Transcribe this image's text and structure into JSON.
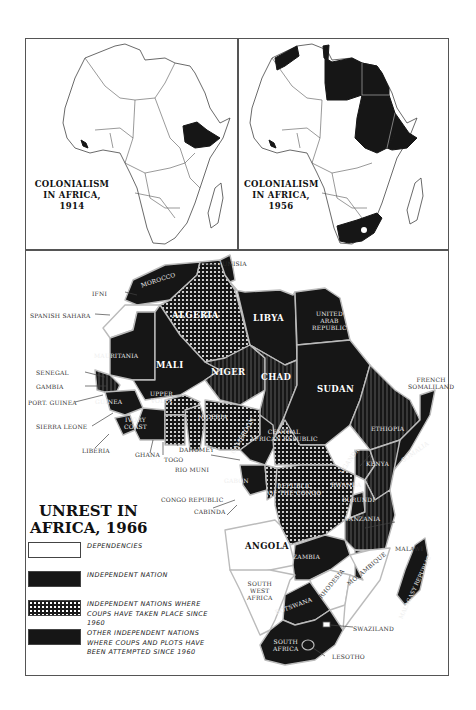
{
  "panels": {
    "map_1914": {
      "title_line1": "COLONIALISM",
      "title_line2": "IN AFRICA, 1914",
      "independent_shaded": [
        "Liberia",
        "Ethiopia"
      ]
    },
    "map_1956": {
      "title_line1": "COLONIALISM",
      "title_line2": "IN AFRICA, 1956",
      "independent_shaded": [
        "Morocco",
        "Tunisia",
        "Libya",
        "Egypt",
        "Sudan",
        "Ethiopia",
        "Liberia",
        "South Africa"
      ]
    },
    "map_1966": {
      "title_line1": "UNREST IN",
      "title_line2": "AFRICA, 1966"
    }
  },
  "legend": {
    "items": [
      {
        "key": "dependencies",
        "label": "DEPENDENCIES",
        "pattern": "white"
      },
      {
        "key": "independent",
        "label": "INDEPENDENT NATION",
        "pattern": "black"
      },
      {
        "key": "coups",
        "label": "INDEPENDENT NATIONS WHERE COUPS HAVE TAKEN PLACE SINCE 1960",
        "pattern": "dots"
      },
      {
        "key": "plots",
        "label": "OTHER INDEPENDENT NATIONS WHERE COUPS AND PLOTS HAVE BEEN ATTEMPTED SINCE 1960",
        "pattern": "lines"
      }
    ]
  },
  "labels": {
    "external": {
      "tunisia": "TUNISIA",
      "ifni": "IFNI",
      "spanish_sahara": "SPANISH SAHARA",
      "senegal": "SENEGAL",
      "gambia": "GAMBIA",
      "port_guinea": "PORT. GUINEA",
      "sierra_leone": "SIERRA LEONE",
      "liberia": "LIBERIA",
      "ghana": "GHANA",
      "togo": "TOGO",
      "dahomey": "DAHOMEY",
      "rio_muni": "RIO MUNI",
      "congo_republic": "CONGO REPUBLIC",
      "cabinda": "CABINDA",
      "french_somaliland_1": "FRENCH",
      "french_somaliland_2": "SOMALILAND",
      "malawi": "MALAWI",
      "swaziland": "SWAZILAND",
      "lesotho": "LESOTHO",
      "south_west_africa_1": "SOUTH",
      "south_west_africa_2": "WEST",
      "south_west_africa_3": "AFRICA"
    },
    "bold": {
      "algeria": "ALGERIA",
      "libya": "LIBYA",
      "mali": "MALI",
      "niger": "NIGER",
      "chad": "CHAD",
      "sudan": "SUDAN",
      "angola": "ANGOLA"
    },
    "internal": {
      "morocco": "MOROCCO",
      "mauritania": "MAURITANIA",
      "uar_1": "UNITED",
      "uar_2": "ARAB",
      "uar_3": "REPUBLIC",
      "guinea": "GUINEA",
      "upper_volta_1": "UPPER",
      "upper_volta_2": "VOLTA",
      "ivory_coast_1": "IVORY",
      "ivory_coast_2": "COAST",
      "nigeria": "NIGERIA",
      "cameroon": "CAMEROON",
      "car_1": "CENTRAL",
      "car_2": "AFRICAN REPUBLIC",
      "ethiopia": "ETHIOPIA",
      "somalia": "SOMALIA",
      "kenya": "KENYA",
      "uganda": "UGANDA",
      "rwanda": "RWANDA",
      "burundi": "BURUNDI",
      "tanzania": "TANZANIA",
      "gabon": "GABON",
      "congo_1": "REPUBLIC",
      "congo_2": "OF THE CONGO",
      "zambia": "ZAMBIA",
      "rhodesia": "RHODESIA",
      "mozambique": "MOZAMBIQUE",
      "botswana": "BOTSWANA",
      "south_africa_1": "SOUTH",
      "south_africa_2": "AFRICA",
      "malagasy": "MALAGASY REPUBLIC"
    }
  },
  "colors": {
    "ink": "#161616",
    "paper": "#ffffff",
    "frame": "#555555"
  }
}
